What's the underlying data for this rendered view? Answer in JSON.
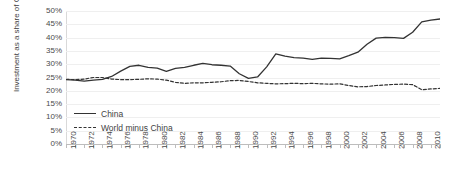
{
  "chart_data": {
    "type": "line",
    "title": "",
    "subtitle": "",
    "xlabel": "",
    "ylabel": "Investment as a share of GDP",
    "xlim": [
      1970,
      2011
    ],
    "ylim": [
      0,
      50
    ],
    "grid": true,
    "legend_position": "inside-bottom-left",
    "y_tick_labels": [
      "50%",
      "45%",
      "40%",
      "35%",
      "30%",
      "25%",
      "20%",
      "15%",
      "10%",
      "5%",
      "0%"
    ],
    "y_tick_values": [
      50,
      45,
      40,
      35,
      30,
      25,
      20,
      15,
      10,
      5,
      0
    ],
    "x_tick_labels": [
      "1970",
      "1972",
      "1974",
      "1976",
      "1978",
      "1980",
      "1982",
      "1984",
      "1986",
      "1988",
      "1990",
      "1992",
      "1994",
      "1996",
      "1998",
      "2000",
      "2002",
      "2004",
      "2006",
      "2008",
      "2010"
    ],
    "x_tick_values": [
      1970,
      1972,
      1974,
      1976,
      1978,
      1980,
      1982,
      1984,
      1986,
      1988,
      1990,
      1992,
      1994,
      1996,
      1998,
      2000,
      2002,
      2004,
      2006,
      2008,
      2010
    ],
    "x": [
      1970,
      1971,
      1972,
      1973,
      1974,
      1975,
      1976,
      1977,
      1978,
      1979,
      1980,
      1981,
      1982,
      1983,
      1984,
      1985,
      1986,
      1987,
      1988,
      1989,
      1990,
      1991,
      1992,
      1993,
      1994,
      1995,
      1996,
      1997,
      1998,
      1999,
      2000,
      2001,
      2002,
      2003,
      2004,
      2005,
      2006,
      2007,
      2008,
      2009,
      2010,
      2011
    ],
    "series": [
      {
        "name": "China",
        "style": "solid",
        "color": "#333333",
        "values": [
          24.2,
          24.0,
          23.6,
          24.0,
          24.3,
          25.4,
          27.4,
          29.2,
          29.6,
          28.8,
          28.5,
          27.3,
          28.4,
          28.8,
          29.6,
          30.3,
          29.8,
          29.6,
          29.3,
          26.4,
          24.7,
          25.2,
          29.0,
          33.9,
          33.0,
          32.5,
          32.3,
          31.8,
          32.3,
          32.2,
          32.0,
          33.2,
          34.5,
          37.5,
          39.8,
          40.1,
          40.0,
          39.7,
          42.0,
          45.9,
          46.6,
          47.0
        ]
      },
      {
        "name": "World minus China",
        "style": "dashed",
        "color": "#333333",
        "values": [
          24.3,
          24.2,
          24.4,
          25.0,
          25.0,
          24.4,
          24.2,
          24.2,
          24.3,
          24.5,
          24.4,
          24.0,
          23.2,
          22.8,
          23.0,
          23.0,
          23.2,
          23.4,
          23.8,
          23.9,
          23.5,
          23.0,
          22.8,
          22.6,
          22.7,
          22.8,
          22.7,
          22.8,
          22.6,
          22.5,
          22.6,
          22.0,
          21.5,
          21.6,
          22.0,
          22.2,
          22.4,
          22.5,
          22.3,
          20.4,
          20.7,
          20.9
        ]
      }
    ]
  },
  "legend": {
    "items": [
      {
        "label": "China",
        "style": "solid"
      },
      {
        "label": "World minus China",
        "style": "dashed"
      }
    ]
  }
}
